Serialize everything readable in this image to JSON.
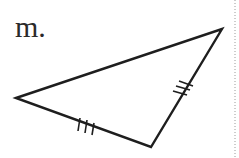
{
  "problem": {
    "label": "m."
  },
  "triangle": {
    "vertices": {
      "left": [
        16,
        98
      ],
      "top_right": [
        222,
        29
      ],
      "bottom": [
        151,
        147
      ]
    },
    "congruence_marks": [
      {
        "side": "left-bottom",
        "ticks": 3
      },
      {
        "side": "bottom-top_right",
        "ticks": 3
      }
    ],
    "stroke_color": "#1e1e1e"
  }
}
